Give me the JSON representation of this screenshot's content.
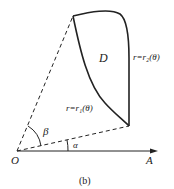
{
  "diagram": {
    "region_label": "D",
    "curve_outer_label": "r=r₂(θ)",
    "curve_inner_label": "r=r₁(θ)",
    "angle_beta": "β",
    "angle_alpha": "α",
    "origin_label": "O",
    "axis_label": "A",
    "caption": "(b)"
  },
  "colors": {
    "stroke": "#222222",
    "background": "#ffffff"
  }
}
